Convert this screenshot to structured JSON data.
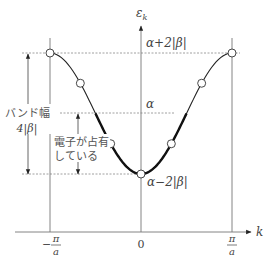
{
  "diagram": {
    "y_axis_label": "ε",
    "y_axis_subscript": "k",
    "x_axis_label": "k",
    "energy_levels": {
      "top": "α+2|β|",
      "middle": "α",
      "bottom": "α−2|β|"
    },
    "x_ticks": {
      "left_minus": "−",
      "left_num": "π",
      "left_den": "a",
      "center": "0",
      "right_num": "π",
      "right_den": "a"
    },
    "band_width_label_line1": "バンド幅",
    "band_width_label_line2": "4|β|",
    "occupied_label_line1": "電子が占有",
    "occupied_label_line2": "している",
    "curve": "ε_k = α − 2|β| cos(ka)",
    "sample_points_ka": [
      -3.1416,
      -2.0944,
      -1.0472,
      0,
      1.0472,
      2.0944,
      3.1416
    ],
    "occupied_range_ka": [
      -1.5708,
      1.5708
    ]
  }
}
